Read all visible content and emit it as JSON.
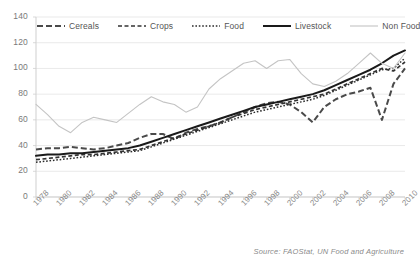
{
  "chart_data": {
    "type": "line",
    "title": "",
    "xlabel": "",
    "ylabel": "",
    "xlim": [
      1978,
      2010
    ],
    "ylim": [
      0,
      140
    ],
    "ytick_step": 20,
    "xtick_step": 2,
    "grid": true,
    "legend_position": "top",
    "source": "Source: FAOStat, UN Food and Agriculture",
    "yticks": [
      "140",
      "120",
      "100",
      "80",
      "60",
      "40",
      "20",
      "0"
    ],
    "xticks": [
      "1978",
      "1980",
      "1982",
      "1984",
      "1986",
      "1988",
      "1990",
      "1992",
      "1994",
      "1996",
      "1998",
      "2000",
      "2002",
      "2004",
      "2006",
      "2008",
      "2010"
    ],
    "x": [
      1978,
      1979,
      1980,
      1981,
      1982,
      1983,
      1984,
      1985,
      1986,
      1987,
      1988,
      1989,
      1990,
      1991,
      1992,
      1993,
      1994,
      1995,
      1996,
      1997,
      1998,
      1999,
      2000,
      2001,
      2002,
      2003,
      2004,
      2005,
      2006,
      2007,
      2008,
      2009,
      2010
    ],
    "series": [
      {
        "name": "Cereals",
        "style": "dashed-thick",
        "color": "#4a4a4a",
        "values": [
          37,
          38,
          38,
          39,
          38,
          37,
          38,
          40,
          42,
          46,
          49,
          49,
          45,
          50,
          53,
          55,
          58,
          62,
          66,
          70,
          73,
          74,
          72,
          66,
          58,
          70,
          76,
          80,
          82,
          85,
          60,
          88,
          100
        ]
      },
      {
        "name": "Crops",
        "style": "dashed-medium",
        "color": "#333333",
        "values": [
          29,
          30,
          31,
          32,
          33,
          33,
          34,
          35,
          36,
          37,
          40,
          43,
          46,
          49,
          52,
          55,
          58,
          62,
          65,
          68,
          70,
          72,
          74,
          76,
          78,
          80,
          84,
          88,
          92,
          96,
          100,
          98,
          105
        ]
      },
      {
        "name": "Food",
        "style": "dotted",
        "color": "#2b2b2b",
        "values": [
          27,
          28,
          29,
          30,
          31,
          32,
          33,
          34,
          35,
          36,
          39,
          42,
          45,
          48,
          51,
          54,
          57,
          60,
          63,
          66,
          68,
          70,
          72,
          74,
          76,
          79,
          83,
          87,
          91,
          95,
          99,
          100,
          108
        ]
      },
      {
        "name": "Livestock",
        "style": "solid-thick",
        "color": "#1a1a1a",
        "values": [
          32,
          33,
          33,
          34,
          34,
          35,
          36,
          37,
          38,
          40,
          43,
          46,
          49,
          52,
          55,
          58,
          61,
          64,
          67,
          70,
          72,
          74,
          76,
          78,
          80,
          83,
          87,
          91,
          95,
          99,
          104,
          110,
          114
        ]
      },
      {
        "name": "Non Food",
        "style": "solid-thin",
        "color": "#c4c4c4",
        "values": [
          72,
          64,
          55,
          50,
          58,
          62,
          60,
          58,
          65,
          72,
          78,
          74,
          72,
          66,
          70,
          84,
          92,
          98,
          104,
          106,
          100,
          106,
          107,
          96,
          88,
          86,
          90,
          96,
          104,
          112,
          104,
          100,
          112
        ]
      }
    ]
  }
}
